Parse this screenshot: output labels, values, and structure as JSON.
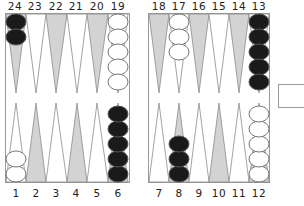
{
  "board": {
    "top_labels": [
      "24",
      "23",
      "22",
      "21",
      "20",
      "19",
      "18",
      "17",
      "16",
      "15",
      "14",
      "13"
    ],
    "bottom_labels": [
      "1",
      "2",
      "3",
      "4",
      "5",
      "6",
      "7",
      "8",
      "9",
      "10",
      "11",
      "12"
    ],
    "colors": {
      "dark_point": "#d3d3d3",
      "light_point": "#ffffff",
      "point_stroke": "#8c8c8c",
      "black_checker": "#1a1a1a",
      "white_checker": "#ffffff",
      "checker_stroke": "#777777",
      "frame": "#9a9a9a"
    },
    "checkers": [
      {
        "point": 24,
        "color": "black",
        "count": 2
      },
      {
        "point": 19,
        "color": "white",
        "count": 5
      },
      {
        "point": 17,
        "color": "white",
        "count": 3
      },
      {
        "point": 13,
        "color": "black",
        "count": 5
      },
      {
        "point": 12,
        "color": "white",
        "count": 5
      },
      {
        "point": 8,
        "color": "black",
        "count": 3
      },
      {
        "point": 6,
        "color": "black",
        "count": 5
      },
      {
        "point": 1,
        "color": "white",
        "count": 2
      }
    ]
  },
  "doubling_cube": {
    "value": ""
  }
}
